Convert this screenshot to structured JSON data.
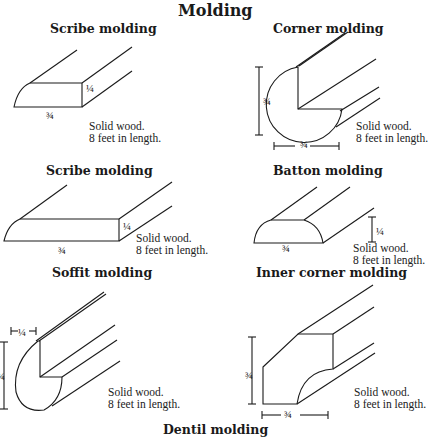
{
  "title": "Molding",
  "sections": [
    {
      "id": "scribe1",
      "label": "Scribe molding",
      "dims": [
        "1/4",
        "3/4"
      ],
      "note_line1": "Solid wood.",
      "note_line2": "8 feet in length."
    },
    {
      "id": "corner",
      "label": "Corner molding",
      "dims": [
        "3/4",
        "3/4"
      ],
      "note_line1": "Solid wood.",
      "note_line2": "8 feet in length."
    },
    {
      "id": "scribe2",
      "label": "Scribe molding",
      "dims": [
        "1/4",
        "3/4"
      ],
      "note_line1": "Solid wood.",
      "note_line2": "8 feet in length."
    },
    {
      "id": "batton",
      "label": "Batton molding",
      "dims": [
        "1/4",
        "3/4"
      ],
      "note_line1": "Solid wood.",
      "note_line2": "8 feet in length."
    },
    {
      "id": "soffit",
      "label": "Soffit molding",
      "dims": [
        "1/4",
        "3/4"
      ],
      "note_line1": "Solid wood.",
      "note_line2": "8 feet in length."
    },
    {
      "id": "inner",
      "label": "Inner corner molding",
      "dims": [
        "3/4",
        "3/4"
      ],
      "note_line1": "Solid wood.",
      "note_line2": "8 feet in length."
    },
    {
      "id": "dentil",
      "label": "Dentil molding"
    }
  ],
  "fractions": {
    "quarter": "¼",
    "three_quarter": "¾"
  }
}
